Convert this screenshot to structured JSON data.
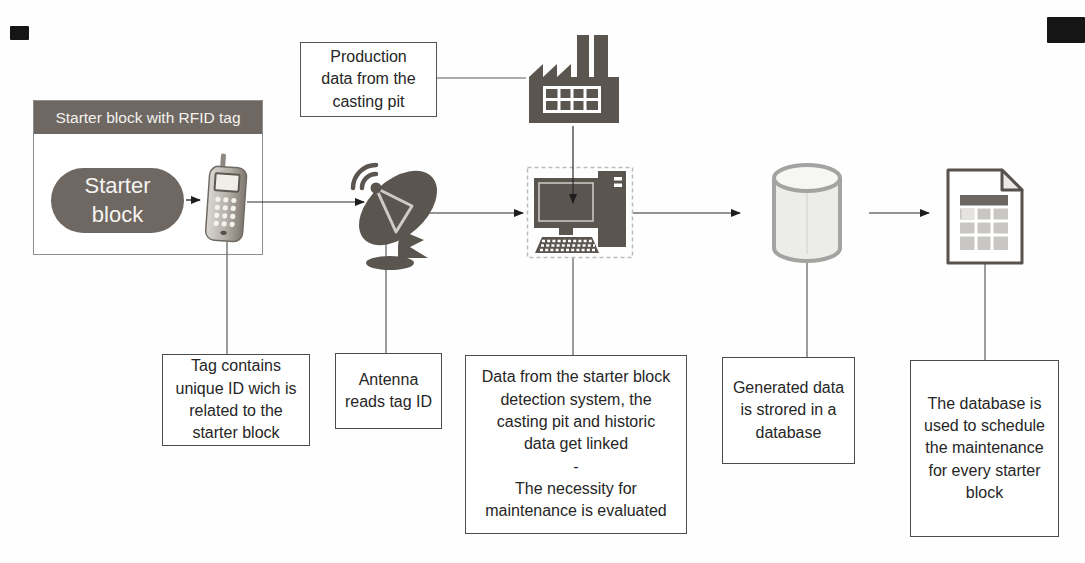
{
  "colors": {
    "icon_dark": "#5b5550",
    "panel_dark": "#6e6762",
    "connector_line": "#4a4a4a",
    "box_border": "#4c4c4c",
    "cylinder_fill": "#ececea",
    "cylinder_stroke": "#a3a3a1"
  },
  "rfid_unit": {
    "header": "Starter block with RFID tag",
    "block_label": "Starter\nblock"
  },
  "boxes": {
    "production": "Production\ndata from the\ncasting pit",
    "tag": "Tag contains\nunique ID wich is\nrelated to the\nstarter block",
    "antenna": "Antenna\nreads tag ID",
    "linking": "Data from the starter block\ndetection system, the\ncasting pit and historic\ndata get linked\n-\nThe necessity for\nmaintenance is evaluated",
    "storage": "Generated data\nis strored in a\ndatabase",
    "schedule": "The database is\nused to schedule\nthe maintenance\nfor every starter\nblock"
  },
  "icons": {
    "rfid_reader": "rfid-reader-phone-icon",
    "antenna": "satellite-dish-icon",
    "factory": "factory-icon",
    "computer": "desktop-computer-icon",
    "database": "database-cylinder-icon",
    "document": "spreadsheet-document-icon"
  }
}
